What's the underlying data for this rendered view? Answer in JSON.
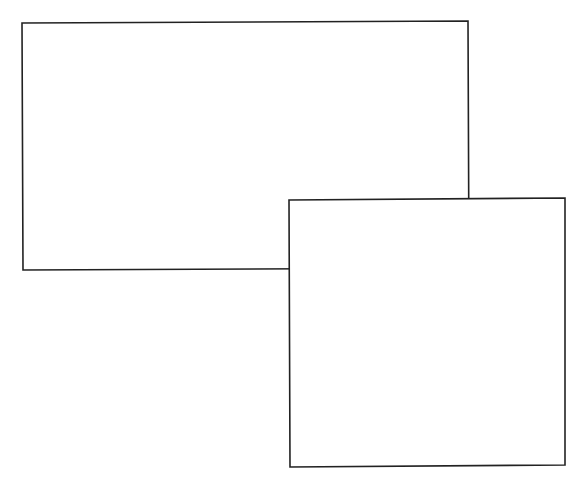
{
  "canvas": {
    "width": 581,
    "height": 484,
    "background": "#ffffff"
  },
  "style": {
    "stroke": "#222222",
    "fill": "#ffffff",
    "stroke_width": 1.6
  },
  "shapes": [
    {
      "id": "rect-back",
      "type": "rectangle",
      "points": "22,23 468,21 469,268 23,270"
    },
    {
      "id": "rect-front",
      "type": "rectangle",
      "points": "289,200 565,198 565,465 290,467"
    }
  ]
}
